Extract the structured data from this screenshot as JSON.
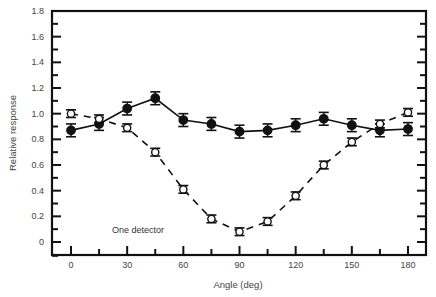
{
  "chart_data": {
    "type": "line",
    "title": "",
    "xlabel": "Angle (deg)",
    "ylabel": "Relative response",
    "xlim": [
      -10,
      190
    ],
    "ylim": [
      -0.1,
      1.8
    ],
    "x_ticks": [
      0,
      30,
      60,
      90,
      120,
      150,
      180
    ],
    "x_tick_labels": [
      "0",
      "30",
      "60",
      "90",
      "120",
      "150",
      "180"
    ],
    "y_ticks": [
      0,
      0.2,
      0.4,
      0.6,
      0.8,
      1.0,
      1.2,
      1.4,
      1.6,
      1.8
    ],
    "y_tick_labels": [
      "0",
      "0.2",
      "0.4",
      "0.6",
      "0.8",
      "1.0",
      "1.2",
      "1.4",
      "1.6",
      "1.8"
    ],
    "grid": false,
    "legend": null,
    "annotations": [
      "One detector"
    ],
    "x": [
      0,
      15,
      30,
      45,
      60,
      75,
      90,
      105,
      120,
      135,
      150,
      165,
      180
    ],
    "series": [
      {
        "name": "filled (solid line)",
        "marker": "filled-circle",
        "line": "solid",
        "values": [
          0.87,
          0.92,
          1.04,
          1.12,
          0.95,
          0.92,
          0.86,
          0.87,
          0.91,
          0.96,
          0.91,
          0.87,
          0.88
        ],
        "error": 0.05
      },
      {
        "name": "One detector (dashed line)",
        "marker": "open-circle",
        "line": "dashed",
        "values": [
          1.0,
          0.96,
          0.89,
          0.7,
          0.41,
          0.18,
          0.08,
          0.16,
          0.36,
          0.6,
          0.78,
          0.92,
          1.01
        ],
        "error": 0.03
      }
    ]
  }
}
